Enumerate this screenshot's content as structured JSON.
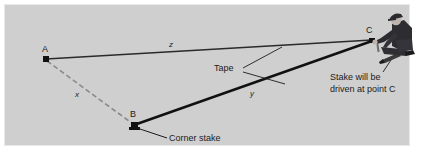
{
  "figure": {
    "background_color": "#cfcfcf",
    "panel_border_color": "#e9e9e9",
    "line_color": "#1b1b1b",
    "dashed_line_color": "#8a8a8a"
  },
  "points": [
    {
      "id": "A",
      "label": "A",
      "x": 46,
      "y": 59,
      "marker": "square"
    },
    {
      "id": "B",
      "label": "B",
      "x": 134,
      "y": 125,
      "marker": "square"
    },
    {
      "id": "C",
      "label": "C",
      "x": 372,
      "y": 41,
      "marker": "square"
    }
  ],
  "segments": [
    {
      "id": "z",
      "label": "z",
      "from": "A",
      "to": "C",
      "style": "solid-thin"
    },
    {
      "id": "y",
      "label": "y",
      "from": "B",
      "to": "C",
      "style": "solid-thick"
    },
    {
      "id": "x",
      "label": "x",
      "from": "A",
      "to": "B",
      "style": "dashed"
    }
  ],
  "annotations": {
    "tape": "Tape",
    "corner_stake": "Corner stake",
    "stake_note_line1": "Stake will be",
    "stake_note_line2": "driven at point C"
  },
  "icons": {
    "surveyor": "kneeling-surveyor-icon",
    "stake": "wooden-stake-icon",
    "point_marker": "survey-point-marker-icon"
  }
}
